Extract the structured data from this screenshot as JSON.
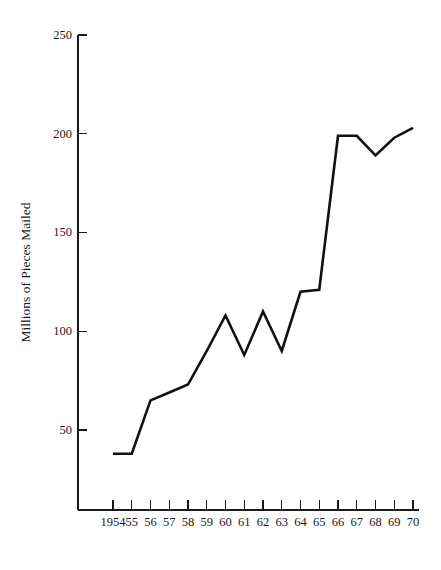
{
  "chart_data": {
    "type": "line",
    "title": "",
    "xlabel": "",
    "ylabel": "Millions of Pieces Mailed",
    "x": [
      1954,
      1955,
      1956,
      1957,
      1958,
      1959,
      1960,
      1961,
      1962,
      1963,
      1964,
      1965,
      1966,
      1967,
      1968,
      1969,
      1970
    ],
    "xtick_labels": [
      "1954",
      "55",
      "56",
      "57",
      "58",
      "59",
      "60",
      "61",
      "62",
      "63",
      "64",
      "65",
      "66",
      "67",
      "68",
      "69",
      "70"
    ],
    "values": [
      38,
      38,
      65,
      69,
      73,
      90,
      108,
      88,
      110,
      90,
      120,
      121,
      199,
      199,
      189,
      198,
      203
    ],
    "ytick_labels": [
      "250",
      "200",
      "150",
      "100",
      "50"
    ],
    "yticks": [
      250,
      200,
      150,
      100,
      50
    ],
    "ylim": [
      0,
      250
    ],
    "xlim": [
      1954,
      1970
    ],
    "grid": false,
    "legend": false,
    "line_color": "#111111",
    "axis_color": "#1a1a1a",
    "background_color": "#ffffff",
    "series": [
      {
        "name": "Pieces Mailed",
        "values": [
          38,
          38,
          65,
          69,
          73,
          90,
          108,
          88,
          110,
          90,
          120,
          121,
          199,
          199,
          189,
          198,
          203
        ]
      }
    ]
  }
}
